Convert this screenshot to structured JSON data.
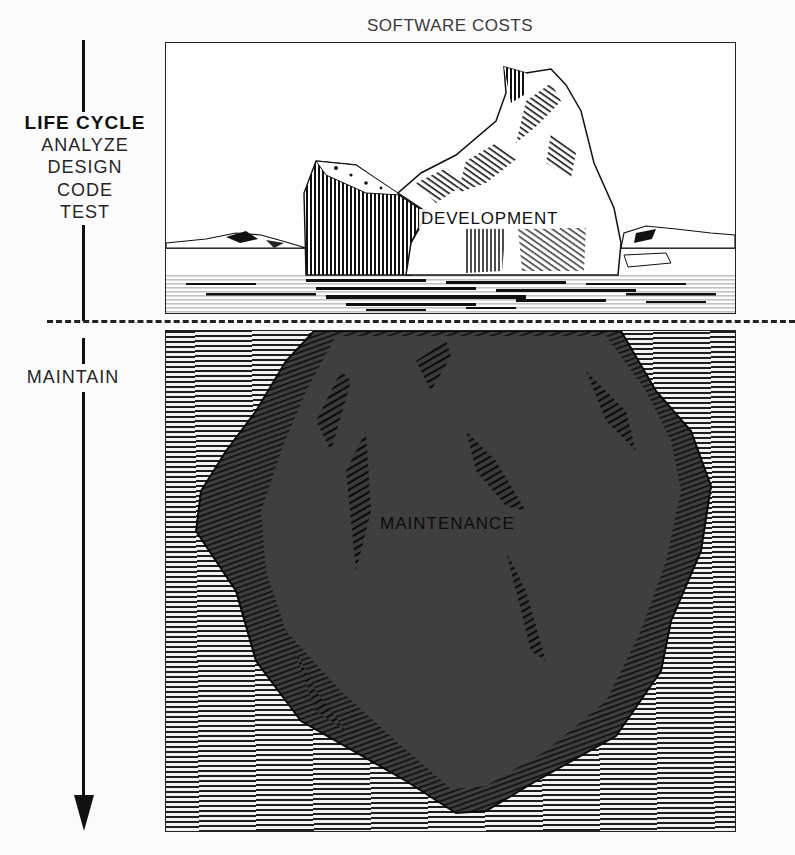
{
  "title": "SOFTWARE COSTS",
  "life_cycle": {
    "heading": "LIFE CYCLE",
    "phases": [
      "ANALYZE",
      "DESIGN",
      "CODE",
      "TEST"
    ],
    "maintain_label": "MAINTAIN",
    "arrow_direction": "down"
  },
  "iceberg": {
    "above_water_label": "DEVELOPMENT",
    "below_water_label": "MAINTENANCE",
    "waterline": "dashed-line"
  },
  "colors": {
    "ink": "#111111",
    "iceberg_underwater": "#3e3e3e",
    "background": "#fbfbfb"
  }
}
